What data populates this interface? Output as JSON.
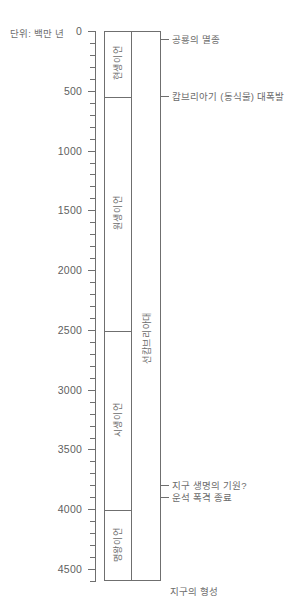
{
  "caption": {
    "unit_label": "단위: 백만 년"
  },
  "chart_data": {
    "type": "table",
    "ylabel": "단위: 백만 년",
    "ylim": [
      0,
      4600
    ],
    "y_inverted": true,
    "grid": false,
    "legend": "none",
    "tick_labels": [
      "0",
      "500",
      "1000",
      "1500",
      "2000",
      "2500",
      "3000",
      "3500",
      "4000",
      "4500"
    ],
    "tick_values": [
      0,
      500,
      1000,
      1500,
      2000,
      2500,
      3000,
      3500,
      4000,
      4500
    ],
    "minor_tick_interval": 100,
    "columns": [
      {
        "name": "eon",
        "bands": [
          {
            "label": "현생이언",
            "start": 0,
            "end": 542
          },
          {
            "label": "원생이언",
            "start": 542,
            "end": 2500
          },
          {
            "label": "시생이언",
            "start": 2500,
            "end": 4000
          },
          {
            "label": "명왕이언",
            "start": 4000,
            "end": 4600
          }
        ]
      },
      {
        "name": "era-group",
        "bands": [
          {
            "label": "선캄브리아대",
            "start": 542,
            "end": 4600
          }
        ]
      }
    ],
    "events": [
      {
        "label": "공룡의 멸종",
        "value": 65
      },
      {
        "label": "캄브리아기 (동식물) 대폭발",
        "value": 542
      },
      {
        "label": "지구 생명의 기원?",
        "value": 3800
      },
      {
        "label": "운석 폭격 종료",
        "value": 3900
      },
      {
        "label": "지구의 형성",
        "value": 4600
      }
    ]
  },
  "colors": {
    "line": "#6f6f6f",
    "text": "#6b6b6b",
    "background": "#ffffff"
  }
}
